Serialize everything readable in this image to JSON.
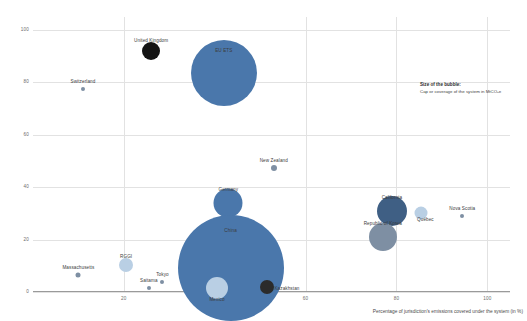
{
  "chart_data": {
    "type": "scatter",
    "title": "",
    "xlabel": "Percentage of jurisdiction's emissions covered under the system (in %)",
    "ylabel": "Average price for allowances in 2021, in USD",
    "xlim": [
      0,
      105
    ],
    "ylim": [
      0,
      105
    ],
    "xticks": [
      20,
      60,
      80,
      100
    ],
    "xtick_labels": [
      "20",
      "60",
      "80",
      "100"
    ],
    "yticks": [
      0,
      20,
      40,
      60,
      80,
      100
    ],
    "ytick_labels": [
      "0",
      "20",
      "40",
      "60",
      "80",
      "100"
    ],
    "grid": true,
    "legend_position": "none",
    "size_legend": {
      "title": "Size of the bubble:",
      "body": "Cap or coverage of the system in MtCO₂e"
    },
    "colors": {
      "primary_blue": "#4a77ab",
      "light_blue": "#b9cfe4",
      "dark": "#1c1c1c",
      "slate": "#7e8fa3",
      "grid": "#e2e2e2",
      "axis": "#9a9a9a",
      "text": "#3f3f3f"
    },
    "points": [
      {
        "name": "United Kingdom",
        "x": 26.0,
        "y": 92.0,
        "size": 9.0,
        "color": "#141414",
        "label_dx": 0,
        "label_dy": -10
      },
      {
        "name": "EU ETS",
        "x": 42.0,
        "y": 83.5,
        "size": 33.0,
        "color": "#4a77ab",
        "label_dx": 0,
        "label_dy": -22
      },
      {
        "name": "Switzerland",
        "x": 11.0,
        "y": 77.5,
        "size": 2.0,
        "color": "#7e8fa3",
        "label_dx": 0,
        "label_dy": -7
      },
      {
        "name": "New Zealand",
        "x": 53.0,
        "y": 47.5,
        "size": 3.0,
        "color": "#7e8fa3",
        "label_dx": 0,
        "label_dy": -7
      },
      {
        "name": "Germany",
        "x": 43.0,
        "y": 34.0,
        "size": 14.5,
        "color": "#4a77ab",
        "label_dx": 0,
        "label_dy": -13
      },
      {
        "name": "California",
        "x": 79.0,
        "y": 31.0,
        "size": 15.0,
        "color": "#3f5f84",
        "label_dx": 0,
        "label_dy": -13
      },
      {
        "name": "Québec",
        "x": 85.5,
        "y": 30.0,
        "size": 6.5,
        "color": "#b9cfe4",
        "label_dx": 4,
        "label_dy": 7
      },
      {
        "name": "Nova Scotia",
        "x": 94.5,
        "y": 29.0,
        "size": 2.0,
        "color": "#7e8fa3",
        "label_dx": 0,
        "label_dy": -7
      },
      {
        "name": "Republic of Korea",
        "x": 77.0,
        "y": 21.0,
        "size": 14.0,
        "color": "#7e8fa3",
        "label_dx": 0,
        "label_dy": -13
      },
      {
        "name": "RGGI",
        "x": 20.5,
        "y": 10.5,
        "size": 7.0,
        "color": "#b9cfe4",
        "label_dx": 0,
        "label_dy": -8
      },
      {
        "name": "Massachusetts",
        "x": 10.0,
        "y": 6.5,
        "size": 2.5,
        "color": "#7e8fa3",
        "label_dx": 0,
        "label_dy": -7
      },
      {
        "name": "China",
        "x": 43.5,
        "y": 9.0,
        "size": 53.0,
        "color": "#4a77ab",
        "label_dx": 0,
        "label_dy": -37
      },
      {
        "name": "Tokyo",
        "x": 28.5,
        "y": 4.0,
        "size": 2.0,
        "color": "#7e8fa3",
        "label_dx": 0,
        "label_dy": -7
      },
      {
        "name": "Saitama",
        "x": 25.5,
        "y": 1.5,
        "size": 2.0,
        "color": "#7e8fa3",
        "label_dx": 0,
        "label_dy": -7
      },
      {
        "name": "Mexico",
        "x": 40.5,
        "y": 1.5,
        "size": 11.0,
        "color": "#b9cfe4",
        "label_dx": 0,
        "label_dy": 12
      },
      {
        "name": "Kazakhstan",
        "x": 51.5,
        "y": 2.0,
        "size": 7.0,
        "color": "#2b2b2b",
        "label_dx": 20,
        "label_dy": 2
      }
    ]
  }
}
